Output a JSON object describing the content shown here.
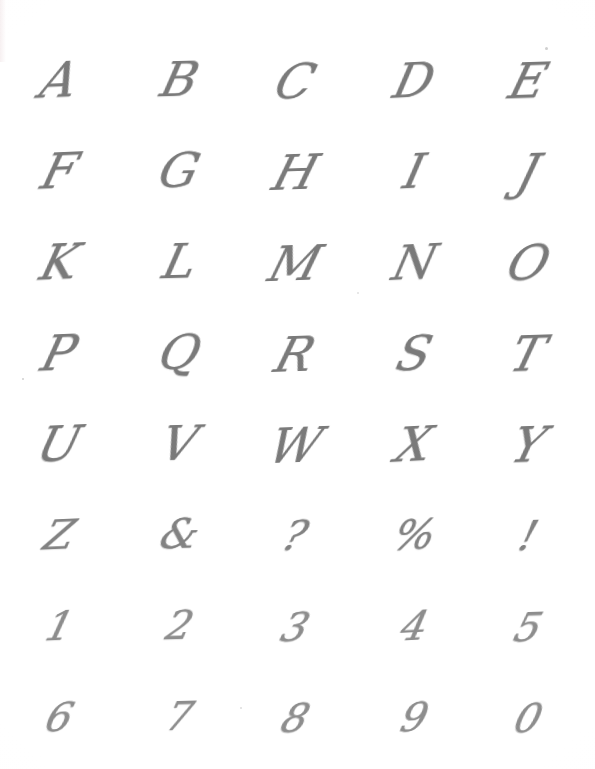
{
  "document": {
    "kind": "handwritten-calligraphy-practice-sheet",
    "ink_color": "#7c7c7c",
    "paper_color": "#fefefe",
    "columns": 5,
    "rows": 8
  },
  "rows": [
    {
      "kind": "letters",
      "cells": [
        "A",
        "B",
        "C",
        "D",
        "E"
      ]
    },
    {
      "kind": "letters",
      "cells": [
        "F",
        "G",
        "H",
        "I",
        "J"
      ]
    },
    {
      "kind": "letters",
      "cells": [
        "K",
        "L",
        "M",
        "N",
        "O"
      ]
    },
    {
      "kind": "letters",
      "cells": [
        "P",
        "Q",
        "R",
        "S",
        "T"
      ]
    },
    {
      "kind": "letters",
      "cells": [
        "U",
        "V",
        "W",
        "X",
        "Y"
      ]
    },
    {
      "kind": "symbols",
      "cells": [
        "Z",
        "&",
        "?",
        "%",
        "!"
      ]
    },
    {
      "kind": "digits",
      "cells": [
        "1",
        "2",
        "3",
        "4",
        "5"
      ]
    },
    {
      "kind": "digits",
      "cells": [
        "6",
        "7",
        "8",
        "9",
        "0"
      ]
    }
  ]
}
